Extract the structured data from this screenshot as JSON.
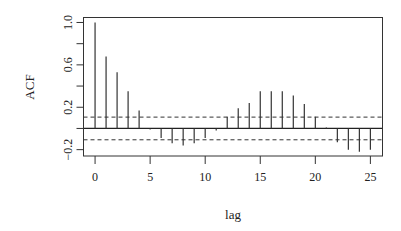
{
  "chart_data": {
    "type": "bar",
    "subtype": "acf-stem",
    "title": "",
    "xlabel": "lag",
    "ylabel": "ACF",
    "x": [
      0,
      1,
      2,
      3,
      4,
      5,
      6,
      7,
      8,
      9,
      10,
      11,
      12,
      13,
      14,
      15,
      16,
      17,
      18,
      19,
      20,
      21,
      22,
      23,
      24,
      25
    ],
    "values": [
      1.0,
      0.68,
      0.53,
      0.35,
      0.17,
      -0.01,
      -0.09,
      -0.14,
      -0.16,
      -0.14,
      -0.09,
      -0.02,
      0.11,
      0.19,
      0.24,
      0.35,
      0.35,
      0.35,
      0.31,
      0.23,
      0.11,
      0.01,
      -0.13,
      -0.2,
      -0.22,
      -0.2
    ],
    "confidence_bounds": [
      -0.107,
      0.107
    ],
    "xlim": [
      -1.05,
      26.1
    ],
    "ylim": [
      -0.26,
      1.047
    ],
    "xticks": [
      0,
      5,
      10,
      15,
      20,
      25
    ],
    "xtick_labels": [
      "0",
      "5",
      "10",
      "15",
      "20",
      "25"
    ],
    "yticks": [
      -0.2,
      0.2,
      0.6,
      1.0
    ],
    "ytick_labels": [
      "−0.2",
      "0.2",
      "0.6",
      "1.0"
    ],
    "yticks_minor": [
      0.0,
      0.4,
      0.8
    ],
    "grid": false,
    "legend": null,
    "colors": {
      "stem": "#333333",
      "axis": "#333333",
      "bounds": "#333333",
      "zero": "#222222"
    }
  }
}
